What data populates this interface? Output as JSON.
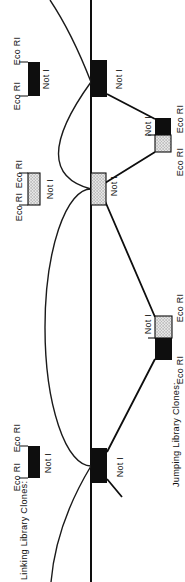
{
  "figure": {
    "background": "#ffffff",
    "ink": "#0e0e0e",
    "stipple_fill": "#e4e4e4",
    "stipple_dot": "#6a6a6a",
    "linking_section_label": "Linking Library Clones:",
    "jumping_section_label": "Jumping Library Clones:",
    "enzyme_eco": "Eco RI",
    "enzyme_not": "Not I"
  }
}
